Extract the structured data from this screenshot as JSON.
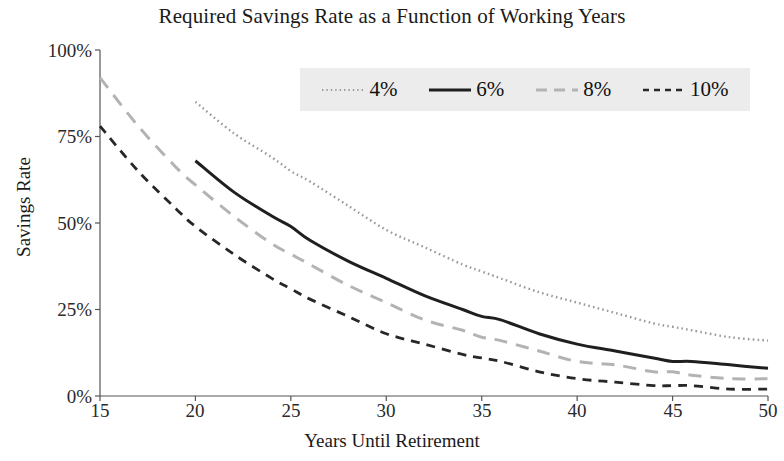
{
  "chart_data": {
    "type": "line",
    "title": "Required Savings Rate as a Function of Working Years",
    "xlabel": "Years Until Retirement",
    "ylabel": "Savings Rate",
    "xlim": [
      15,
      50
    ],
    "ylim": [
      0,
      100
    ],
    "xticks": [
      "15",
      "20",
      "25",
      "30",
      "35",
      "40",
      "45",
      "50"
    ],
    "xtick_values": [
      15,
      20,
      25,
      30,
      35,
      40,
      45,
      50
    ],
    "yticks": [
      "0%",
      "25%",
      "50%",
      "75%",
      "100%"
    ],
    "ytick_values": [
      0,
      25,
      50,
      75,
      100
    ],
    "grid": false,
    "legend_position": "top-center",
    "series": [
      {
        "name": "4%",
        "style": "dotted",
        "color": "#9a9a9a",
        "x": [
          20,
          22,
          24,
          25,
          26,
          28,
          30,
          32,
          34,
          35,
          36,
          38,
          40,
          42,
          44,
          45,
          46,
          48,
          50
        ],
        "values": [
          85,
          76,
          69,
          65,
          62,
          55,
          48,
          43,
          38,
          36,
          34,
          30,
          27,
          24,
          21,
          20,
          19,
          17,
          16
        ]
      },
      {
        "name": "6%",
        "style": "solid",
        "color": "#1f1f1f",
        "x": [
          20,
          22,
          24,
          25,
          26,
          28,
          30,
          32,
          34,
          35,
          36,
          38,
          40,
          42,
          44,
          45,
          46,
          48,
          50
        ],
        "values": [
          68,
          59,
          52,
          49,
          45,
          39,
          34,
          29,
          25,
          23,
          22,
          18,
          15,
          13,
          11,
          10,
          10,
          9,
          8
        ]
      },
      {
        "name": "8%",
        "style": "longdash",
        "color": "#b3b3b3",
        "x": [
          15,
          17,
          19,
          20,
          22,
          24,
          25,
          26,
          28,
          30,
          32,
          34,
          35,
          36,
          38,
          40,
          42,
          44,
          45,
          46,
          48,
          50
        ],
        "values": [
          92,
          78,
          66,
          61,
          52,
          44,
          41,
          38,
          32,
          27,
          22,
          19,
          17,
          16,
          13,
          10,
          9,
          7,
          7,
          6,
          5,
          5
        ]
      },
      {
        "name": "10%",
        "style": "dashed",
        "color": "#272727",
        "x": [
          15,
          17,
          19,
          20,
          22,
          24,
          25,
          26,
          28,
          30,
          32,
          34,
          35,
          36,
          38,
          40,
          42,
          44,
          45,
          46,
          48,
          50
        ],
        "values": [
          78,
          65,
          54,
          49,
          41,
          34,
          31,
          28,
          23,
          18,
          15,
          12,
          11,
          10,
          7,
          5,
          4,
          3,
          3,
          3,
          2,
          2
        ]
      }
    ]
  },
  "legend": {
    "items": [
      {
        "label": "4%"
      },
      {
        "label": "6%"
      },
      {
        "label": "8%"
      },
      {
        "label": "10%"
      }
    ]
  }
}
